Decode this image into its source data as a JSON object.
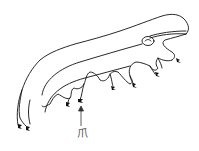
{
  "figure": {
    "annotation": {
      "label": "爪",
      "arrow_target": "claw"
    },
    "colors": {
      "ink": "#111111",
      "background": "#ffffff"
    }
  }
}
